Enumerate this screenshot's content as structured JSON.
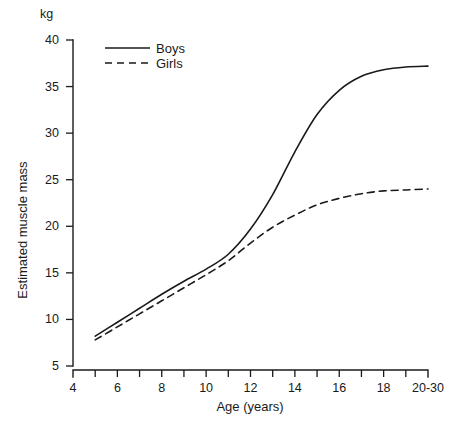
{
  "chart_data": {
    "type": "line",
    "title": "",
    "subtitle": "",
    "xlabel": "Age (years)",
    "ylabel": "Estimated muscle mass",
    "yunit": "kg",
    "xlim": [
      4,
      20
    ],
    "ylim": [
      5,
      40
    ],
    "grid": false,
    "legend_position": "top-left",
    "x_tick_labels": [
      "4",
      "6",
      "8",
      "10",
      "12",
      "14",
      "16",
      "18",
      "20-30"
    ],
    "x_tick_values": [
      4,
      6,
      8,
      10,
      12,
      14,
      16,
      18,
      20
    ],
    "x_minor_tick_values": [
      5,
      7,
      9,
      11,
      13,
      15,
      17,
      19
    ],
    "y_tick_labels": [
      "40",
      "35",
      "30",
      "25",
      "20",
      "15",
      "10",
      "5"
    ],
    "y_tick_values": [
      40,
      35,
      30,
      25,
      20,
      15,
      10,
      5
    ],
    "x": [
      5,
      6,
      7,
      8,
      9,
      10,
      11,
      12,
      13,
      14,
      15,
      16,
      17,
      18,
      19,
      20
    ],
    "series": [
      {
        "name": "Boys",
        "style": "solid",
        "color": "#1a1a1a",
        "values": [
          8.2,
          9.7,
          11.2,
          12.7,
          14.1,
          15.4,
          17.0,
          19.7,
          23.4,
          28.0,
          32.0,
          34.6,
          36.1,
          36.8,
          37.1,
          37.2
        ]
      },
      {
        "name": "Girls",
        "style": "dashed",
        "color": "#1a1a1a",
        "values": [
          7.8,
          9.2,
          10.6,
          12.0,
          13.4,
          14.8,
          16.3,
          18.2,
          19.9,
          21.2,
          22.3,
          23.0,
          23.5,
          23.8,
          23.9,
          24.0
        ]
      }
    ]
  },
  "legend": {
    "entries": [
      {
        "label": "Boys",
        "style": "solid"
      },
      {
        "label": "Girls",
        "style": "dashed"
      }
    ]
  }
}
